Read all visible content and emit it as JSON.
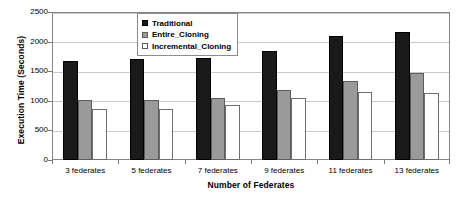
{
  "chart_data": {
    "type": "bar",
    "title": "",
    "xlabel": "Number of Federates",
    "ylabel": "Execution Time (Seconds)",
    "categories": [
      "3 federates",
      "5 federates",
      "7 federates",
      "9 federates",
      "11 federates",
      "13 federates"
    ],
    "series": [
      {
        "name": "Traditional",
        "values": [
          1670,
          1700,
          1730,
          1840,
          2100,
          2160
        ],
        "color": "#1a1a1a"
      },
      {
        "name": "Entire_Cloning",
        "values": [
          1010,
          1020,
          1050,
          1190,
          1330,
          1470
        ],
        "color": "#9a9a9a"
      },
      {
        "name": "Incremental_Cloning",
        "values": [
          860,
          860,
          930,
          1040,
          1150,
          1130
        ],
        "color": "#ffffff"
      }
    ],
    "ylim": [
      0,
      2500
    ],
    "ytick_values": [
      0,
      500,
      1000,
      1500,
      2000,
      2500
    ],
    "ytick_labels": [
      "0",
      "500",
      "1000",
      "1500",
      "2000",
      "2500"
    ],
    "grid": true,
    "grid_axis": "y",
    "legend_position": "top-center",
    "legend_entries": [
      "Traditional",
      "Entire_Cloning",
      "Incremental_Cloning"
    ],
    "bar_edge_color": "#000000",
    "plot_border_color": "#868686",
    "gridline_color": "#c9c9c9"
  }
}
